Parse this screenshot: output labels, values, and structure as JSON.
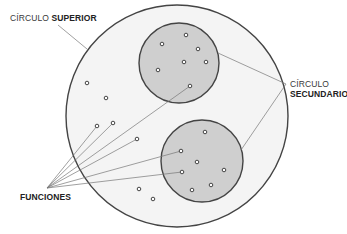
{
  "labels": {
    "superior_prefix": "CÍRCULO",
    "superior_bold": "SUPERIOR",
    "secundario_line1": "CÍRCULO",
    "secundario_line2": "SECUNDARIO",
    "funciones": "FUNCIONES"
  },
  "colors": {
    "outer_fill": "#f4f4f4",
    "inner_fill": "#cfcfcf",
    "stroke": "#444444",
    "leader": "#777777"
  },
  "diagram": {
    "outer_circle": {
      "cx": 177,
      "cy": 116,
      "r": 111
    },
    "secondary_circles": [
      {
        "cx": 179,
        "cy": 63,
        "r": 40
      },
      {
        "cx": 202,
        "cy": 161,
        "r": 41
      }
    ],
    "functions_in_upper": [
      [
        186,
        35
      ],
      [
        162,
        44
      ],
      [
        198,
        49
      ],
      [
        184,
        62
      ],
      [
        206,
        62
      ],
      [
        158,
        70
      ],
      [
        190,
        86
      ]
    ],
    "functions_in_lower": [
      [
        205,
        132
      ],
      [
        181,
        151
      ],
      [
        197,
        162
      ],
      [
        182,
        172
      ],
      [
        224,
        170
      ],
      [
        211,
        185
      ],
      [
        192,
        190
      ]
    ],
    "functions_outer": [
      [
        87,
        83
      ],
      [
        106,
        98
      ],
      [
        97,
        126
      ],
      [
        113,
        123
      ],
      [
        137,
        139
      ],
      [
        139,
        189
      ],
      [
        153,
        199
      ]
    ]
  }
}
